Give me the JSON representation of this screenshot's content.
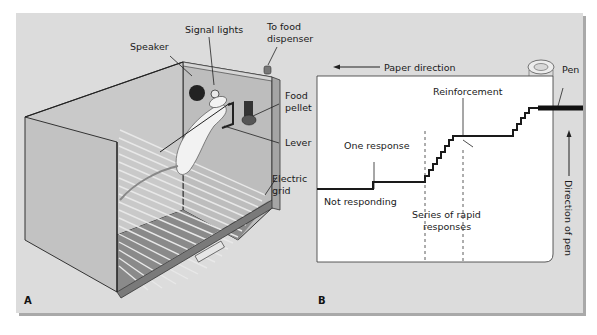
{
  "figure": {
    "panel_a": {
      "letter": "A",
      "title": "Skinner box",
      "labels": {
        "speaker": "Speaker",
        "signal_lights": "Signal lights",
        "to_food_1": "To food",
        "to_food_2": "dispenser",
        "food_1": "Food",
        "food_2": "pellet",
        "lever": "Lever",
        "grid_1": "Electric",
        "grid_2": "grid"
      }
    },
    "panel_b": {
      "letter": "B",
      "title": "Cumulative recorder",
      "labels": {
        "paper_direction": "Paper direction",
        "pen": "Pen",
        "reinforcement": "Reinforcement",
        "one_response": "One response",
        "not_responding": "Not responding",
        "series_1": "Series of rapid",
        "series_2": "responses",
        "direction_of_pen": "Direction of pen"
      }
    }
  },
  "colors": {
    "panel_bg": "#dcdcdc",
    "paper": "#ffffff",
    "ink": "#1a1a1a",
    "box_wall": "#bdbdbd",
    "box_dark": "#9a9a9a",
    "rat": "#f2f2f2"
  }
}
